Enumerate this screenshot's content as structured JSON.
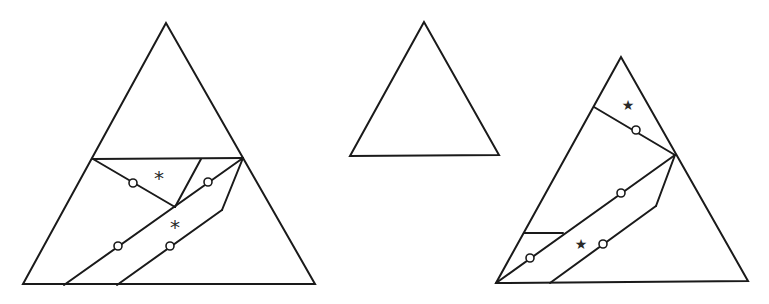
{
  "diagram": {
    "stroke_color": "#1a1a1a",
    "background": "#ffffff",
    "figures": [
      {
        "id": "left-triangle",
        "outline": [
          [
            166,
            23
          ],
          [
            23,
            284
          ],
          [
            315,
            284
          ]
        ],
        "segments": [
          [
            [
              93,
              159
            ],
            [
              243,
              158
            ]
          ],
          [
            [
              93,
              159
            ],
            [
              175,
              207
            ]
          ],
          [
            [
              201,
              159
            ],
            [
              175,
              207
            ]
          ],
          [
            [
              64,
              285
            ],
            [
              243,
              158
            ]
          ],
          [
            [
              117,
              285
            ],
            [
              222,
              210
            ]
          ],
          [
            [
              222,
              210
            ],
            [
              243,
              158
            ]
          ]
        ],
        "circles": [
          [
            133,
            183
          ],
          [
            208,
            182
          ],
          [
            118,
            246
          ],
          [
            170,
            246
          ]
        ],
        "marks": [
          {
            "glyph": "*",
            "x": 159,
            "y": 178,
            "size": 20
          },
          {
            "glyph": "*",
            "x": 175,
            "y": 227,
            "size": 20
          }
        ]
      },
      {
        "id": "middle-triangle",
        "outline": [
          [
            424,
            22
          ],
          [
            350,
            156
          ],
          [
            499,
            155
          ]
        ],
        "segments": [],
        "circles": [],
        "marks": []
      },
      {
        "id": "right-triangle",
        "outline": [
          [
            621,
            57
          ],
          [
            496,
            283
          ],
          [
            748,
            281
          ]
        ],
        "segments": [
          [
            [
              594,
              107
            ],
            [
              675,
              155
            ]
          ],
          [
            [
              496,
              283
            ],
            [
              675,
              155
            ]
          ],
          [
            [
              524,
              233
            ],
            [
              563,
              233
            ]
          ],
          [
            [
              550,
              283
            ],
            [
              656,
              206
            ]
          ],
          [
            [
              656,
              206
            ],
            [
              675,
              155
            ]
          ]
        ],
        "circles": [
          [
            636,
            130
          ],
          [
            621,
            193
          ],
          [
            530,
            258
          ],
          [
            603,
            244
          ]
        ],
        "marks": [
          {
            "glyph": "★",
            "x": 628,
            "y": 105,
            "size": 14
          },
          {
            "glyph": "★",
            "x": 581,
            "y": 244,
            "size": 14
          }
        ]
      }
    ]
  }
}
